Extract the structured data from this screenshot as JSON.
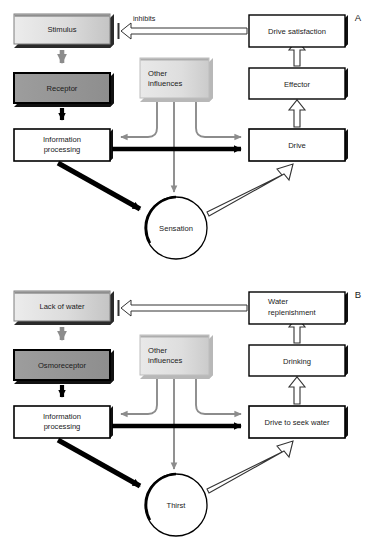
{
  "figure": {
    "title_visible": false,
    "width": 378,
    "height": 543,
    "background": "#ffffff"
  },
  "colors": {
    "stimulus_fill_light": "#e8e8e8",
    "stimulus_fill_dark": "#bdbdbd",
    "receptor_fill": "#9a9a9a",
    "other_influences_fill_light": "#e4e4e4",
    "other_influences_fill_dark": "#cfcfcf",
    "white_box_fill": "#ffffff",
    "black_stroke": "#000000",
    "gray_stroke": "#8c8c8c",
    "gray_arrow": "#8c8c8c",
    "hollow_arrow_stroke": "#3a3a3a",
    "text": "#1a1a1a",
    "shadow": "#222222"
  },
  "panels": [
    {
      "id": "panel-a",
      "label": "A",
      "nodes": {
        "stimulus": {
          "label": "Stimulus",
          "style": "gray-gradient-3d"
        },
        "receptor": {
          "label": "Receptor",
          "style": "dark-gray-3d"
        },
        "information_processing": {
          "label_line1": "Information",
          "label_line2": "processing",
          "style": "white-3d"
        },
        "other_influences": {
          "label_line1": "Other",
          "label_line2": "influences",
          "style": "light-gray-gradient"
        },
        "sensation": {
          "label": "Sensation",
          "style": "circle-outline"
        },
        "drive": {
          "label": "Drive",
          "style": "white-3d"
        },
        "effector": {
          "label": "Effector",
          "style": "white-3d"
        },
        "drive_satisfaction": {
          "label": "Drive satisfaction",
          "style": "white-3d"
        }
      },
      "edges": [
        {
          "from": "stimulus",
          "to": "receptor",
          "kind": "gray-solid",
          "label": ""
        },
        {
          "from": "receptor",
          "to": "information_processing",
          "kind": "black-solid",
          "label": ""
        },
        {
          "from": "information_processing",
          "to": "drive",
          "kind": "black-solid",
          "label": ""
        },
        {
          "from": "information_processing",
          "to": "sensation",
          "kind": "black-solid-diagonal",
          "label": ""
        },
        {
          "from": "other_influences",
          "to": "information_processing",
          "kind": "gray-curved",
          "label": ""
        },
        {
          "from": "other_influences",
          "to": "drive",
          "kind": "gray-curved",
          "label": ""
        },
        {
          "from": "other_influences",
          "to": "sensation",
          "kind": "gray-straight",
          "label": ""
        },
        {
          "from": "sensation",
          "to": "drive",
          "kind": "hollow-diagonal",
          "label": ""
        },
        {
          "from": "drive",
          "to": "effector",
          "kind": "hollow-vertical",
          "label": ""
        },
        {
          "from": "effector",
          "to": "drive_satisfaction",
          "kind": "hollow-vertical",
          "label": ""
        },
        {
          "from": "drive_satisfaction",
          "to": "stimulus",
          "kind": "hollow-horizontal",
          "label": "inhibits"
        }
      ]
    },
    {
      "id": "panel-b",
      "label": "B",
      "nodes": {
        "stimulus": {
          "label": "Lack of water",
          "style": "gray-gradient-3d"
        },
        "receptor": {
          "label": "Osmoreceptor",
          "style": "dark-gray-3d"
        },
        "information_processing": {
          "label_line1": "Information",
          "label_line2": "processing",
          "style": "white-3d"
        },
        "other_influences": {
          "label_line1": "Other",
          "label_line2": "influences",
          "style": "light-gray-gradient"
        },
        "sensation": {
          "label": "Thirst",
          "style": "circle-outline"
        },
        "drive": {
          "label": "Drive to seek water",
          "style": "white-3d"
        },
        "effector": {
          "label": "Drinking",
          "style": "white-3d"
        },
        "drive_satisfaction": {
          "label_line1": "Water",
          "label_line2": "replenishment",
          "style": "white-3d"
        }
      },
      "edges": [
        {
          "from": "stimulus",
          "to": "receptor",
          "kind": "gray-solid",
          "label": ""
        },
        {
          "from": "receptor",
          "to": "information_processing",
          "kind": "black-solid",
          "label": ""
        },
        {
          "from": "information_processing",
          "to": "drive",
          "kind": "black-solid",
          "label": ""
        },
        {
          "from": "information_processing",
          "to": "sensation",
          "kind": "black-solid-diagonal",
          "label": ""
        },
        {
          "from": "other_influences",
          "to": "information_processing",
          "kind": "gray-curved",
          "label": ""
        },
        {
          "from": "other_influences",
          "to": "drive",
          "kind": "gray-curved",
          "label": ""
        },
        {
          "from": "other_influences",
          "to": "sensation",
          "kind": "gray-straight",
          "label": ""
        },
        {
          "from": "sensation",
          "to": "drive",
          "kind": "hollow-diagonal",
          "label": ""
        },
        {
          "from": "drive",
          "to": "effector",
          "kind": "hollow-vertical",
          "label": ""
        },
        {
          "from": "effector",
          "to": "drive_satisfaction",
          "kind": "hollow-vertical",
          "label": ""
        },
        {
          "from": "drive_satisfaction",
          "to": "stimulus",
          "kind": "hollow-horizontal",
          "label": ""
        }
      ]
    }
  ]
}
